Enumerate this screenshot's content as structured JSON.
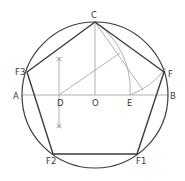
{
  "colors": {
    "background": "#ffffff",
    "primary_stroke": "#3c3c3c",
    "construction_stroke": "#a8a8a8",
    "label": "#3a3a3a"
  },
  "points": {
    "C": {
      "label": "C",
      "x": 95,
      "y": 22
    },
    "F": {
      "label": "F",
      "x": 164,
      "y": 72
    },
    "F1": {
      "label": "F1",
      "x": 137,
      "y": 154
    },
    "F2": {
      "label": "F2",
      "x": 53,
      "y": 154
    },
    "F3": {
      "label": "F3",
      "x": 27,
      "y": 72
    },
    "A": {
      "label": "A",
      "x": 22,
      "y": 95
    },
    "B": {
      "label": "B",
      "x": 168,
      "y": 95
    },
    "O": {
      "label": "O",
      "x": 95,
      "y": 95
    },
    "D": {
      "label": "D",
      "x": 59,
      "y": 95
    },
    "E": {
      "label": "E",
      "x": 130,
      "y": 95
    }
  },
  "labels": [
    {
      "text": "C",
      "x": 92,
      "y": 17
    },
    {
      "text": "F3",
      "x": 17,
      "y": 74
    },
    {
      "text": "F",
      "x": 167,
      "y": 76
    },
    {
      "text": "A",
      "x": 15,
      "y": 99
    },
    {
      "text": "D",
      "x": 59,
      "y": 106
    },
    {
      "text": "O",
      "x": 92,
      "y": 106
    },
    {
      "text": "E",
      "x": 127,
      "y": 106
    },
    {
      "text": "B",
      "x": 170,
      "y": 99
    },
    {
      "text": "F2",
      "x": 45,
      "y": 163
    },
    {
      "text": "F1",
      "x": 136,
      "y": 163
    }
  ],
  "circle": {
    "cx": 95,
    "cy": 95,
    "r": 73
  }
}
